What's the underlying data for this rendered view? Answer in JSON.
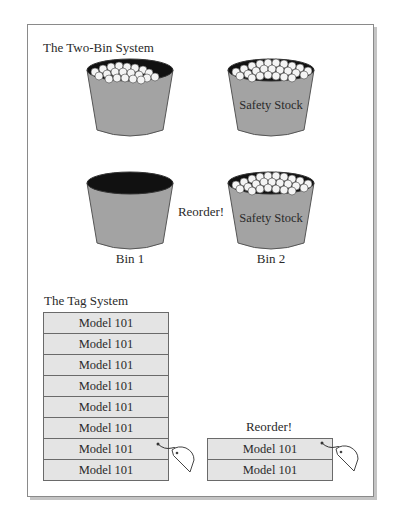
{
  "two_bin": {
    "title": "The Two-Bin System",
    "top_row": {
      "bin1": {
        "state": "partially-full",
        "inner_label": ""
      },
      "bin2": {
        "state": "full",
        "inner_label": "Safety Stock"
      }
    },
    "bottom_row": {
      "bin1": {
        "state": "empty",
        "inner_label": "",
        "caption": "Bin 1"
      },
      "signal": "Reorder!",
      "bin2": {
        "state": "full",
        "inner_label": "Safety Stock",
        "caption": "Bin 2"
      }
    }
  },
  "tag_system": {
    "title": "The Tag System",
    "left_stack": {
      "rows": [
        "Model 101",
        "Model 101",
        "Model 101",
        "Model 101",
        "Model 101",
        "Model 101",
        "Model 101",
        "Model 101"
      ],
      "tag_attached_row_index": 6
    },
    "right_stack": {
      "signal": "Reorder!",
      "rows": [
        "Model 101",
        "Model 101"
      ],
      "tag_attached_row_index": 0
    }
  },
  "colors": {
    "bin_fill": "#a3a3a3",
    "bin_outline": "#555555",
    "bin_interior": "#111111",
    "stock_items": "#f4f4f4",
    "row_fill": "#e4e4e4",
    "row_border": "#6a6a6a",
    "frame_border": "#8a8a8a"
  }
}
